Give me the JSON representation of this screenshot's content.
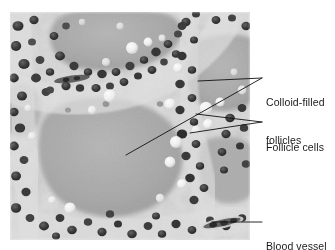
{
  "figure": {
    "type": "labeled-histology-micrograph",
    "background_color": "#ffffff",
    "image_region": {
      "x": 10,
      "y": 12,
      "width": 240,
      "height": 228
    },
    "tone": {
      "light": "#e8e8e8",
      "mid": "#b0b0b0",
      "dark": "#2a2a2a"
    }
  },
  "labels": [
    {
      "id": "colloid-filled-follicles",
      "line1": "Colloid-filled",
      "line2": "follicles",
      "text_x": 266,
      "text_y": 71,
      "leaders": [
        {
          "from_x": 262,
          "from_y": 78,
          "to_x": 198,
          "to_y": 81
        },
        {
          "from_x": 262,
          "from_y": 78,
          "to_x": 126,
          "to_y": 155
        }
      ]
    },
    {
      "id": "follicle-cells",
      "line1": "Follicle cells",
      "line2": "",
      "text_x": 266,
      "text_y": 116,
      "leaders": [
        {
          "from_x": 262,
          "from_y": 122,
          "to_x": 196,
          "to_y": 114
        },
        {
          "from_x": 262,
          "from_y": 122,
          "to_x": 190,
          "to_y": 133
        }
      ]
    },
    {
      "id": "blood-vessel",
      "line1": "Blood vessel",
      "line2": "",
      "text_x": 266,
      "text_y": 215,
      "leaders": [
        {
          "from_x": 262,
          "from_y": 222,
          "to_x": 212,
          "to_y": 222
        }
      ]
    }
  ],
  "leader_line": {
    "color": "#111111",
    "width": 0.9
  },
  "micrograph_features": {
    "colloid_lumens": [
      {
        "cx": 95,
        "cy": 150,
        "rx": 78,
        "ry": 62,
        "tone": "#a9a9a9"
      },
      {
        "cx": 108,
        "cy": 28,
        "rx": 62,
        "ry": 34,
        "tone": "#a3a3a3"
      },
      {
        "cx": 218,
        "cy": 62,
        "rx": 44,
        "ry": 38,
        "tone": "#a6a6a6"
      },
      {
        "cx": 22,
        "cy": 96,
        "rx": 22,
        "ry": 26,
        "tone": "#b4b4b4"
      }
    ],
    "cell_band_tone": "#d8d8d8",
    "nucleus_tone": "#2e2e2e",
    "vesicle_tone": "#f6f6f6",
    "blood_vessel": {
      "cx": 222,
      "cy": 223,
      "angle": -12
    }
  }
}
